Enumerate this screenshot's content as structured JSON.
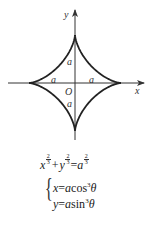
{
  "diagram": {
    "center": {
      "x": 75,
      "y": 83
    },
    "radius_x": 46,
    "radius_y": 48,
    "curve_color": "#222222",
    "axis_color": "#333333",
    "axes": {
      "x_label": "x",
      "y_label": "y",
      "origin_label": "O"
    },
    "segment_labels": {
      "top": "a",
      "bottom": "a",
      "left": "a",
      "right": "a"
    }
  },
  "equations": {
    "cartesian": {
      "x": "x",
      "plus": "+",
      "y": "y",
      "equals": "=",
      "a": "a",
      "exp_num": "2",
      "exp_den": "3"
    },
    "parametric": {
      "line1": {
        "lhs": "x",
        "eq": "=",
        "coef": "a",
        "fn": "cos",
        "pow": "3",
        "var": "θ"
      },
      "line2": {
        "lhs": "y",
        "eq": "=",
        "coef": "a",
        "fn": "sin",
        "pow": "3",
        "var": "θ"
      }
    }
  }
}
